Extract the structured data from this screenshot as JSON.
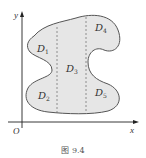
{
  "figure": {
    "caption": "图 9.4",
    "axes": {
      "x_label": "x",
      "y_label": "y",
      "origin_label": "O"
    },
    "regions": [
      {
        "name": "D",
        "sub": "1"
      },
      {
        "name": "D",
        "sub": "2"
      },
      {
        "name": "D",
        "sub": "3"
      },
      {
        "name": "D",
        "sub": "4"
      },
      {
        "name": "D",
        "sub": "5"
      }
    ],
    "colors": {
      "fill": "#e6e6e6",
      "outline": "#555555",
      "axis": "#222222",
      "dashed": "#777777"
    }
  }
}
